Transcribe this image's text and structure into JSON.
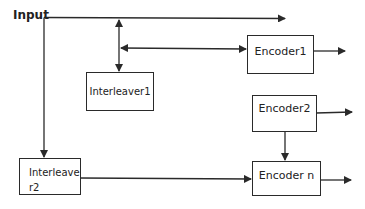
{
  "diagram": {
    "input_label": "Input",
    "nodes": {
      "interleaver1": {
        "label": "Interleaver1"
      },
      "interleaver2": {
        "label_line1": "Interleave",
        "label_line2": "r2"
      },
      "encoder1": {
        "label": "Encoder1"
      },
      "encoder2": {
        "label": "Encoder2"
      },
      "encodern": {
        "label": "Encoder n"
      }
    },
    "edges": [
      {
        "from": "input",
        "to": "output-top",
        "note": "top line arrow to right"
      },
      {
        "from": "input",
        "to": "interleaver1",
        "note": "bidirectional vertical"
      },
      {
        "from": "interleaver1-line",
        "to": "encoder1",
        "note": "bidirectional horizontal"
      },
      {
        "from": "input",
        "to": "interleaver2"
      },
      {
        "from": "interleaver2",
        "to": "encodern"
      },
      {
        "from": "encoder2",
        "to": "encodern"
      },
      {
        "from": "encoder1",
        "to": "output"
      },
      {
        "from": "encoder2",
        "to": "output"
      },
      {
        "from": "encodern",
        "to": "output"
      }
    ],
    "colors": {
      "stroke": "#2a2a2a",
      "background": "#ffffff"
    }
  }
}
